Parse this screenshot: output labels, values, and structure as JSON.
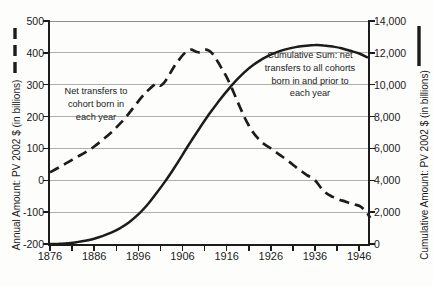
{
  "chart_data": {
    "type": "line",
    "title": "",
    "grid": true,
    "colors": {
      "ink": "#1c1c1c",
      "gridline": "#aeaeae",
      "background": "#fdfdfc"
    },
    "x_axis": {
      "range": [
        1876,
        1948
      ],
      "tick_label_years": [
        1876,
        1886,
        1896,
        1906,
        1916,
        1926,
        1936,
        1946
      ],
      "tick_labels": [
        "1876",
        "1886",
        "1896",
        "1906",
        "1916",
        "1926",
        "1936",
        "1946"
      ],
      "minor_tick_years": [
        1876,
        1881,
        1886,
        1891,
        1896,
        1901,
        1906,
        1911,
        1916,
        1921,
        1926,
        1931,
        1936,
        1941,
        1946
      ]
    },
    "left_axis": {
      "title": "Annual Amount: PV 2002 $ (in billions)",
      "range": [
        -200,
        500
      ],
      "tick_values": [
        500,
        400,
        300,
        200,
        100,
        0,
        -100,
        -200
      ],
      "tick_labels": [
        "500",
        "400",
        "300",
        "200",
        "100",
        "0",
        "-100",
        "-200"
      ]
    },
    "right_axis": {
      "title": "Cumulative Amount: PV 2002 $ (in billions)",
      "range": [
        0,
        14000
      ],
      "tick_values": [
        14000,
        12000,
        10000,
        8000,
        6000,
        4000,
        2000,
        0
      ],
      "tick_labels": [
        "14,000",
        "12,000",
        "10,000",
        "8,000",
        "6,000",
        "4,000",
        "2,000",
        "0"
      ]
    },
    "annotations": [
      {
        "target": "annual",
        "lines": [
          "Net transfers to",
          "cohort born in",
          "each year"
        ]
      },
      {
        "target": "cumulative",
        "lines": [
          "Cumulative Sum: net",
          "transfers to all cohorts",
          "born in and prior to",
          "each year"
        ]
      }
    ],
    "series": [
      {
        "key": "annual-net-transfers",
        "name": "Net transfers to cohort born in each year",
        "axis": "left",
        "style": "dashed",
        "points": [
          [
            1876,
            25
          ],
          [
            1878,
            40
          ],
          [
            1880,
            56
          ],
          [
            1882,
            72
          ],
          [
            1884,
            88
          ],
          [
            1886,
            106
          ],
          [
            1888,
            128
          ],
          [
            1890,
            152
          ],
          [
            1892,
            180
          ],
          [
            1894,
            212
          ],
          [
            1896,
            248
          ],
          [
            1898,
            280
          ],
          [
            1900,
            303
          ],
          [
            1901,
            297
          ],
          [
            1902,
            309
          ],
          [
            1903,
            331
          ],
          [
            1904,
            355
          ],
          [
            1905,
            374
          ],
          [
            1906,
            392
          ],
          [
            1907,
            404
          ],
          [
            1908,
            410
          ],
          [
            1909,
            404
          ],
          [
            1910,
            402
          ],
          [
            1911,
            410
          ],
          [
            1912,
            407
          ],
          [
            1913,
            394
          ],
          [
            1914,
            372
          ],
          [
            1915,
            348
          ],
          [
            1916,
            324
          ],
          [
            1917,
            294
          ],
          [
            1918,
            262
          ],
          [
            1919,
            230
          ],
          [
            1920,
            199
          ],
          [
            1921,
            172
          ],
          [
            1922,
            150
          ],
          [
            1923,
            133
          ],
          [
            1924,
            119
          ],
          [
            1925,
            109
          ],
          [
            1926,
            100
          ],
          [
            1928,
            80
          ],
          [
            1930,
            60
          ],
          [
            1932,
            38
          ],
          [
            1934,
            18
          ],
          [
            1936,
            0
          ],
          [
            1938,
            -34
          ],
          [
            1940,
            -52
          ],
          [
            1942,
            -63
          ],
          [
            1944,
            -72
          ],
          [
            1945,
            -76
          ],
          [
            1946,
            -80
          ],
          [
            1947,
            -90
          ],
          [
            1947.7,
            -100
          ],
          [
            1948.5,
            -118
          ]
        ]
      },
      {
        "key": "cumulative-sum",
        "name": "Cumulative Sum: net transfers to all cohorts born in and prior to each year",
        "axis": "right",
        "style": "solid",
        "points": [
          [
            1876,
            0
          ],
          [
            1878,
            15
          ],
          [
            1880,
            50
          ],
          [
            1882,
            115
          ],
          [
            1884,
            200
          ],
          [
            1886,
            330
          ],
          [
            1888,
            510
          ],
          [
            1890,
            730
          ],
          [
            1892,
            1020
          ],
          [
            1894,
            1390
          ],
          [
            1896,
            1860
          ],
          [
            1898,
            2450
          ],
          [
            1900,
            3150
          ],
          [
            1902,
            3900
          ],
          [
            1904,
            4720
          ],
          [
            1906,
            5600
          ],
          [
            1908,
            6480
          ],
          [
            1910,
            7330
          ],
          [
            1912,
            8140
          ],
          [
            1914,
            8890
          ],
          [
            1916,
            9580
          ],
          [
            1918,
            10220
          ],
          [
            1920,
            10780
          ],
          [
            1922,
            11240
          ],
          [
            1924,
            11600
          ],
          [
            1926,
            11890
          ],
          [
            1928,
            12110
          ],
          [
            1930,
            12270
          ],
          [
            1932,
            12380
          ],
          [
            1934,
            12450
          ],
          [
            1936,
            12490
          ],
          [
            1938,
            12470
          ],
          [
            1940,
            12400
          ],
          [
            1942,
            12290
          ],
          [
            1944,
            12130
          ],
          [
            1946,
            11960
          ],
          [
            1948,
            11700
          ]
        ]
      }
    ]
  }
}
